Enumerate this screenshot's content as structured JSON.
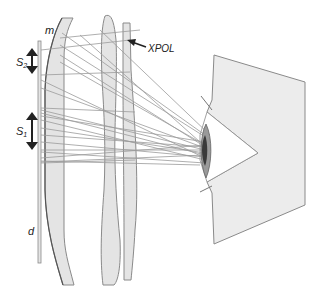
{
  "labels": {
    "mirror": "m",
    "polarizer": "XPOL",
    "s2_main": "S",
    "s2_sub": "2",
    "s1_main": "S",
    "s1_sub": "1",
    "display": "d"
  },
  "colors": {
    "lens_fill": "#e4e4e4",
    "lens_stroke": "#8a8a8a",
    "ray": "#9a9a9a",
    "arrow": "#222222",
    "face_fill": "#ececec",
    "face_stroke": "#8a8a8a",
    "iris": "#9a9a9a",
    "pupil": "#3a3a3a"
  }
}
